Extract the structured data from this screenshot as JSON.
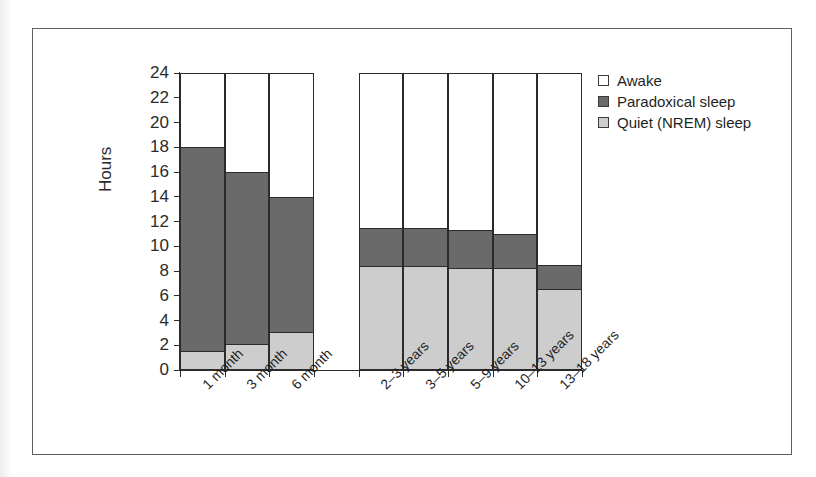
{
  "figure": {
    "scan_caption": "",
    "y_axis_title": "Hours"
  },
  "legend": {
    "items": [
      {
        "label": "Awake",
        "swatch": "awake-swatch",
        "color": "#ffffff"
      },
      {
        "label": "Paradoxical sleep",
        "swatch": "paradoxical-swatch",
        "color": "#6a6a6a"
      },
      {
        "label": "Quiet (NREM) sleep",
        "swatch": "nrem-swatch",
        "color": "#cdcdcd"
      }
    ]
  },
  "chart_data": {
    "type": "bar",
    "stacked": true,
    "title": "",
    "xlabel": "",
    "ylabel": "Hours",
    "ylim": [
      0,
      24
    ],
    "yticks": [
      0,
      2,
      4,
      6,
      8,
      10,
      12,
      14,
      16,
      18,
      20,
      22,
      24
    ],
    "grid": false,
    "legend_position": "right-top",
    "categories": [
      "1 month",
      "3 month",
      "6 month",
      "2–3 years",
      "3–5 years",
      "5–9 years",
      "10–13 years",
      "13–18 years"
    ],
    "series": [
      {
        "name": "Quiet (NREM) sleep",
        "color": "#cdcdcd",
        "values": [
          1.5,
          2.0,
          3.0,
          8.4,
          8.4,
          8.2,
          8.2,
          6.5
        ]
      },
      {
        "name": "Paradoxical sleep",
        "color": "#6a6a6a",
        "values": [
          16.6,
          14.0,
          11.0,
          3.1,
          3.1,
          3.1,
          2.8,
          2.0
        ]
      },
      {
        "name": "Awake",
        "color": "#ffffff",
        "values": [
          5.9,
          8.0,
          10.0,
          12.5,
          12.5,
          12.7,
          13.0,
          15.5
        ]
      }
    ],
    "stack_tops": {
      "nrem": [
        1.5,
        2.0,
        3.0,
        8.4,
        8.4,
        8.2,
        8.2,
        6.5
      ],
      "sleep_total": [
        18.1,
        16.0,
        14.0,
        11.5,
        11.5,
        11.3,
        11.0,
        8.5
      ],
      "total": [
        24,
        24,
        24,
        24,
        24,
        24,
        24,
        24
      ]
    }
  }
}
